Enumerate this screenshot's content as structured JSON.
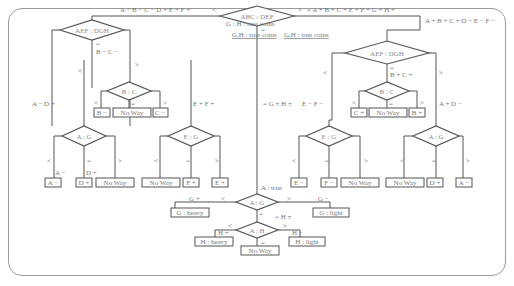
{
  "diagram": {
    "top": {
      "root": "ABC : DEF",
      "left_branch_label": "A − B − C − D + E + F +",
      "left_sign": "<",
      "right_sign": ">",
      "right_branch_label": "= A + B + C + E + F + G + H +",
      "right_branch_label2": "A + B + C + D − E − F −",
      "eq_sign": "=",
      "note_gh": "G : H : true coins",
      "note_gh2": "G,H : true coins"
    },
    "left": {
      "node": "AEF : DGH",
      "eq_label": "B − C −",
      "eq_sign": "=",
      "lt_sign": "<",
      "gt_sign": ">",
      "lt_label": "A − D +",
      "gt_label": "E + F +",
      "bc": {
        "node": "B : C",
        "lt": "<",
        "eq": "=",
        "gt": ">",
        "results": [
          "B −",
          "No Way",
          "C −"
        ]
      },
      "ag": {
        "node": "A : G",
        "lt": "<",
        "eq": "=",
        "gt": ">",
        "lt_label": "A −",
        "eq_label": "D +",
        "results": [
          "A −",
          "D +",
          "No Way"
        ]
      },
      "eg": {
        "node": "E : G",
        "lt": "<",
        "eq": "=",
        "gt": ">",
        "results": [
          "No Way",
          "F +",
          "E +"
        ]
      }
    },
    "right": {
      "node": "AEF : DGH",
      "eq_label": "B + C +",
      "eq_sign": "=",
      "lt_sign": "<",
      "gt_sign": ">",
      "lt_label": "E − F −",
      "gt_label": "A + D −",
      "bc": {
        "node": "B : C",
        "lt": "<",
        "eq": "=",
        "gt": ">",
        "results": [
          "C +",
          "No Way",
          "B +"
        ]
      },
      "eg": {
        "node": "E : G",
        "lt": "<",
        "eq": "=",
        "gt": ">",
        "results": [
          "E −",
          "F −",
          "No Way"
        ]
      },
      "ag": {
        "node": "A : G",
        "lt": "<",
        "eq": "=",
        "gt": ">",
        "results": [
          "No Way",
          "D +",
          "A −"
        ]
      }
    },
    "middle": {
      "label": "= G ± H ±",
      "a_true": "A : true",
      "ag": {
        "node": "A : G",
        "lt": "<",
        "gt": ">",
        "eq": "=",
        "lt_label": "G +",
        "gt_label": "G −",
        "lt_result": "G : heavy",
        "gt_result": "G : light",
        "eq_label": "= H ±"
      },
      "ah": {
        "node": "A : H",
        "lt": "<",
        "gt": ">",
        "eq": "=",
        "lt_label": "H +",
        "gt_label": "H −",
        "lt_result": "H : heavy",
        "gt_result": "H : light",
        "eq_result": "No Way"
      }
    }
  }
}
